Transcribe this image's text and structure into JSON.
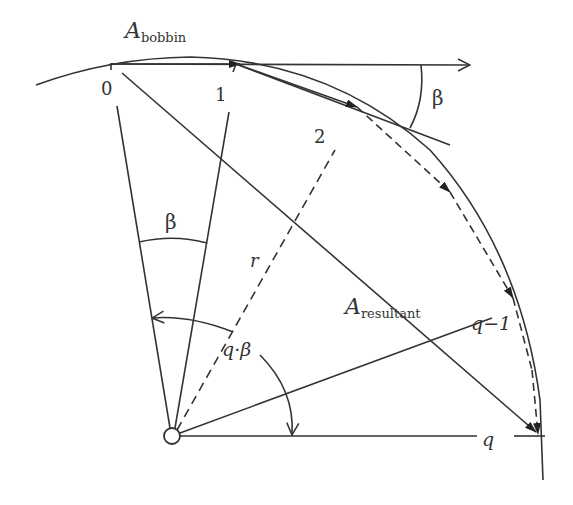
{
  "diagram": {
    "title_label": {
      "main": "A",
      "sub": "bobbin"
    },
    "resultant_label": {
      "main": "A",
      "sub": "resultant"
    },
    "point_labels": [
      "0",
      "1",
      "2",
      "q−1",
      "q"
    ],
    "radius_label": "r",
    "angle_labels": {
      "beta_top": "β",
      "beta_sector": "β",
      "q_beta": "q·β"
    },
    "colors": {
      "stroke": "#333333",
      "background": "#ffffff"
    }
  }
}
